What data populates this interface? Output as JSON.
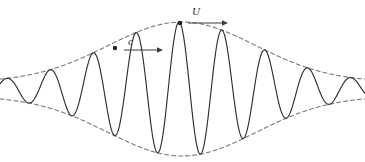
{
  "figure": {
    "name": "wave-packet-diagram",
    "width": 365,
    "height": 162,
    "background_color": "#ffffff"
  },
  "labels": {
    "phase_velocity": "c",
    "group_velocity": "U"
  },
  "annotations": [
    {
      "id": "phase-velocity-annotation",
      "label": "c",
      "meaning": "phase velocity of individual wave crest",
      "dot": {
        "x": 115,
        "y": 48
      },
      "arrow": {
        "x1": 124,
        "y1": 50,
        "x2": 163,
        "y2": 50
      },
      "label_position": {
        "x": 128,
        "y": 36
      }
    },
    {
      "id": "group-velocity-annotation",
      "label": "U",
      "meaning": "group velocity of the wave envelope",
      "dot": {
        "x": 180,
        "y": 23
      },
      "arrow": {
        "x1": 188,
        "y1": 23,
        "x2": 228,
        "y2": 23
      },
      "label_position": {
        "x": 192,
        "y": 6
      }
    }
  ],
  "colors": {
    "carrier_line": "#2f2f2f",
    "envelope_line": "#7a7a7a",
    "arrow": "#3a3a3a",
    "text": "#2b2b2b",
    "background": "#ffffff"
  },
  "chart_data": {
    "type": "line",
    "title": "",
    "subtitle": "",
    "xlabel": "",
    "ylabel": "",
    "grid": false,
    "legend_position": "none",
    "xlim": [
      0,
      365
    ],
    "ylim": [
      162,
      0
    ],
    "baseline_y": 89,
    "carrier": {
      "name": "carrier-wave",
      "style": "solid",
      "color": "#2f2f2f",
      "wavelength_px": 43.0,
      "phase_offset_px": 7.0,
      "amplitude_max_px": 67
    },
    "envelope": {
      "name": "envelope",
      "style": "dashed",
      "color": "#7a7a7a",
      "dash_pattern": [
        4,
        3
      ],
      "center_x": 182,
      "sigma_px": 74,
      "peak_amplitude_px": 67,
      "edge_amplitude_px": 7,
      "upper_peak_y": 23,
      "lower_trough_y": 155
    },
    "series": [
      {
        "name": "upper envelope",
        "points": [
          [
            0,
            82
          ],
          [
            18,
            80
          ],
          [
            36,
            76
          ],
          [
            54,
            70
          ],
          [
            72,
            62
          ],
          [
            90,
            52
          ],
          [
            108,
            43
          ],
          [
            126,
            34
          ],
          [
            144,
            28
          ],
          [
            162,
            24
          ],
          [
            182,
            23
          ],
          [
            200,
            24
          ],
          [
            218,
            28
          ],
          [
            236,
            34
          ],
          [
            254,
            43
          ],
          [
            272,
            52
          ],
          [
            290,
            62
          ],
          [
            308,
            70
          ],
          [
            326,
            76
          ],
          [
            344,
            80
          ],
          [
            365,
            82
          ]
        ]
      },
      {
        "name": "lower envelope",
        "points": [
          [
            0,
            96
          ],
          [
            18,
            98
          ],
          [
            36,
            102
          ],
          [
            54,
            108
          ],
          [
            72,
            116
          ],
          [
            90,
            126
          ],
          [
            108,
            135
          ],
          [
            126,
            144
          ],
          [
            144,
            150
          ],
          [
            162,
            154
          ],
          [
            182,
            155
          ],
          [
            200,
            154
          ],
          [
            218,
            150
          ],
          [
            236,
            144
          ],
          [
            254,
            135
          ],
          [
            272,
            126
          ],
          [
            290,
            116
          ],
          [
            308,
            108
          ],
          [
            326,
            102
          ],
          [
            344,
            98
          ],
          [
            365,
            96
          ]
        ]
      },
      {
        "name": "carrier wave",
        "crest_x": [
          7,
          50,
          93,
          136,
          179,
          222,
          265,
          308,
          351
        ],
        "trough_x": [
          28,
          71,
          114,
          157,
          200,
          243,
          286,
          329
        ]
      }
    ]
  }
}
